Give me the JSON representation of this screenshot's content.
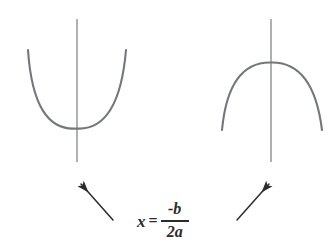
{
  "figure": {
    "background_color": "#ffffff",
    "curve_color": "#73777a",
    "axis_color": "#8c9093",
    "arrow_color": "#2b2b2b",
    "text_color": "#2b2b2b"
  },
  "formula": {
    "variable": "x",
    "equals": "=",
    "numerator": "-b",
    "denominator": "2a",
    "full_text": "x = -b/2a"
  },
  "parabolas": [
    {
      "id": "left-parabola",
      "opening": "upward",
      "vertex": {
        "x": 76,
        "y": 128
      },
      "left_endpoint": {
        "x": 28,
        "y": 50
      },
      "right_endpoint": {
        "x": 126,
        "y": 50
      },
      "axis_line": {
        "x": 77,
        "y_top": 19,
        "y_bottom": 162
      }
    },
    {
      "id": "right-parabola",
      "opening": "downward",
      "vertex": {
        "x": 271,
        "y": 62
      },
      "left_endpoint": {
        "x": 222,
        "y": 130
      },
      "right_endpoint": {
        "x": 322,
        "y": 130
      },
      "axis_line": {
        "x": 271,
        "y_top": 19,
        "y_bottom": 162
      }
    }
  ],
  "arrows": [
    {
      "id": "left-arrow",
      "direction": "up-left",
      "tail": {
        "x": 113,
        "y": 220
      },
      "head": {
        "x": 78,
        "y": 181
      }
    },
    {
      "id": "right-arrow",
      "direction": "up-right",
      "tail": {
        "x": 237,
        "y": 220
      },
      "head": {
        "x": 272,
        "y": 181
      }
    }
  ]
}
